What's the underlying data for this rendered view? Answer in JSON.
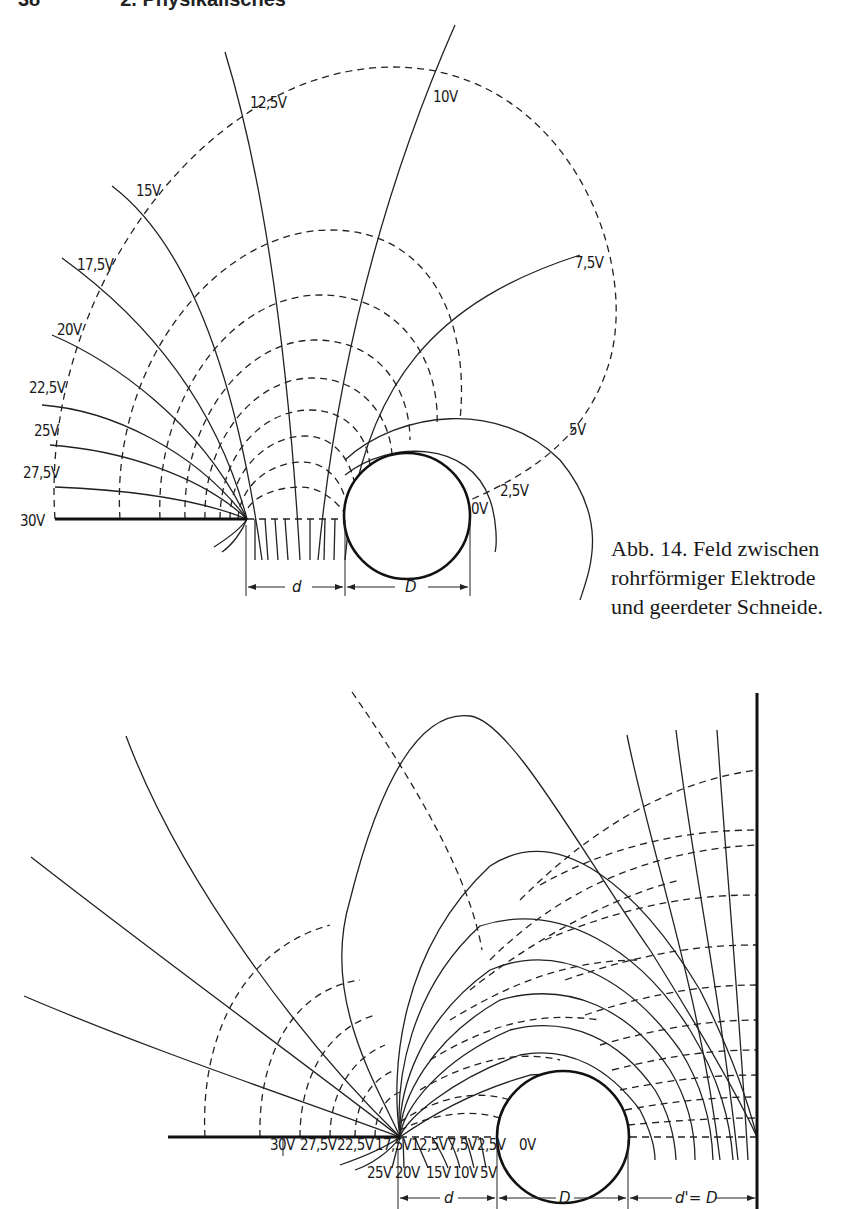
{
  "page": {
    "header_page_number": "38",
    "header_title": "2. Physikalisches"
  },
  "figure_top": {
    "equipotential_labels": [
      {
        "text": "30V",
        "x": 20,
        "y": 526
      },
      {
        "text": "27,5V",
        "x": 23,
        "y": 478
      },
      {
        "text": "25V",
        "x": 34,
        "y": 436
      },
      {
        "text": "22,5V",
        "x": 29,
        "y": 393
      },
      {
        "text": "20V",
        "x": 57,
        "y": 335
      },
      {
        "text": "17,5V",
        "x": 77,
        "y": 270
      },
      {
        "text": "15V",
        "x": 136,
        "y": 196
      },
      {
        "text": "12,5V",
        "x": 250,
        "y": 108
      },
      {
        "text": "10V",
        "x": 433,
        "y": 102
      },
      {
        "text": "7,5V",
        "x": 575,
        "y": 268
      },
      {
        "text": "5V",
        "x": 569,
        "y": 435
      },
      {
        "text": "2,5V",
        "x": 500,
        "y": 496
      },
      {
        "text": "0V",
        "x": 471,
        "y": 514
      }
    ],
    "dimension_d": "d",
    "dimension_D": "D"
  },
  "caption": {
    "lines": [
      "Abb. 14. Feld zwischen",
      "rohrförmiger Elektrode",
      "und geerdeter Schneide."
    ]
  },
  "figure_bottom": {
    "labels_row1": [
      {
        "text": "30V",
        "x": 270
      },
      {
        "text": "27,5V",
        "x": 300
      },
      {
        "text": "22,5V",
        "x": 337
      },
      {
        "text": "17,5V",
        "x": 375
      },
      {
        "text": "12,5V",
        "x": 411
      },
      {
        "text": "7,5V",
        "x": 448
      },
      {
        "text": "2,5V",
        "x": 477
      },
      {
        "text": "0V",
        "x": 519
      }
    ],
    "labels_row2": [
      {
        "text": "25V",
        "x": 367
      },
      {
        "text": "20V",
        "x": 395
      },
      {
        "text": "15V",
        "x": 426
      },
      {
        "text": "10V",
        "x": 453
      },
      {
        "text": "5V",
        "x": 480
      }
    ],
    "dimension_d": "d",
    "dimension_D": "D",
    "dimension_d_prime": "d'= D"
  }
}
